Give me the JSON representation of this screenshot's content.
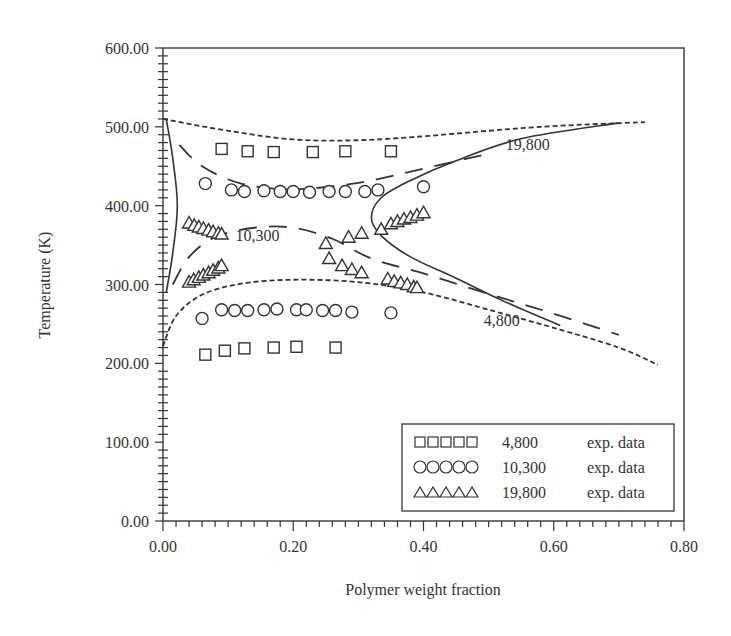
{
  "chart_data": {
    "type": "scatter",
    "title": "",
    "xlabel": "Polymer weight fraction",
    "ylabel": "Temperature (K)",
    "xlim": [
      0.0,
      0.8
    ],
    "ylim": [
      0.0,
      600.0
    ],
    "x_ticks": [
      "0.00",
      "0.20",
      "0.40",
      "0.60",
      "0.80"
    ],
    "y_ticks": [
      "0.00",
      "100.00",
      "200.00",
      "300.00",
      "400.00",
      "500.00",
      "600.00"
    ],
    "grid": false,
    "legend_position": "lower right",
    "legend": [
      {
        "marker": "square",
        "symbols": "□□□□□",
        "label": "4,800",
        "suffix": "exp. data"
      },
      {
        "marker": "circle",
        "symbols": "○○○○○",
        "label": "10,300",
        "suffix": "exp. data"
      },
      {
        "marker": "triangle",
        "symbols": "△△△△△",
        "label": "19,800",
        "suffix": "exp. data"
      }
    ],
    "curve_labels": [
      {
        "text": "19,800",
        "x": 0.56,
        "y": 470
      },
      {
        "text": "10,300",
        "x": 0.145,
        "y": 355
      },
      {
        "text": "4,800",
        "x": 0.52,
        "y": 247
      }
    ],
    "series": [
      {
        "name": "4,800 exp. data",
        "marker": "square",
        "points": [
          [
            0.09,
            472
          ],
          [
            0.13,
            469
          ],
          [
            0.17,
            468
          ],
          [
            0.23,
            468
          ],
          [
            0.28,
            469
          ],
          [
            0.35,
            469
          ],
          [
            0.065,
            211
          ],
          [
            0.095,
            216
          ],
          [
            0.125,
            219
          ],
          [
            0.17,
            220
          ],
          [
            0.205,
            221
          ],
          [
            0.265,
            220
          ]
        ]
      },
      {
        "name": "10,300 exp. data",
        "marker": "circle",
        "points": [
          [
            0.065,
            428
          ],
          [
            0.105,
            420
          ],
          [
            0.125,
            418
          ],
          [
            0.155,
            419
          ],
          [
            0.18,
            418
          ],
          [
            0.2,
            418
          ],
          [
            0.225,
            417
          ],
          [
            0.255,
            418
          ],
          [
            0.28,
            418
          ],
          [
            0.31,
            418
          ],
          [
            0.33,
            420
          ],
          [
            0.4,
            424
          ],
          [
            0.06,
            257
          ],
          [
            0.09,
            268
          ],
          [
            0.11,
            267
          ],
          [
            0.13,
            267
          ],
          [
            0.155,
            268
          ],
          [
            0.175,
            269
          ],
          [
            0.205,
            268
          ],
          [
            0.22,
            268
          ],
          [
            0.245,
            267
          ],
          [
            0.265,
            267
          ],
          [
            0.29,
            265
          ],
          [
            0.35,
            264
          ]
        ]
      },
      {
        "name": "19,800 exp. data",
        "marker": "triangle",
        "points": [
          [
            0.04,
            378
          ],
          [
            0.048,
            375
          ],
          [
            0.055,
            373
          ],
          [
            0.062,
            371
          ],
          [
            0.07,
            369
          ],
          [
            0.077,
            367
          ],
          [
            0.085,
            365
          ],
          [
            0.09,
            364
          ],
          [
            0.04,
            303
          ],
          [
            0.047,
            306
          ],
          [
            0.055,
            309
          ],
          [
            0.062,
            312
          ],
          [
            0.07,
            315
          ],
          [
            0.077,
            318
          ],
          [
            0.085,
            321
          ],
          [
            0.09,
            324
          ],
          [
            0.25,
            352
          ],
          [
            0.255,
            333
          ],
          [
            0.275,
            324
          ],
          [
            0.29,
            319
          ],
          [
            0.305,
            315
          ],
          [
            0.285,
            360
          ],
          [
            0.305,
            365
          ],
          [
            0.335,
            370
          ],
          [
            0.35,
            377
          ],
          [
            0.36,
            380
          ],
          [
            0.37,
            383
          ],
          [
            0.38,
            385
          ],
          [
            0.39,
            388
          ],
          [
            0.4,
            391
          ],
          [
            0.345,
            307
          ],
          [
            0.355,
            304
          ],
          [
            0.365,
            302
          ],
          [
            0.375,
            300
          ],
          [
            0.385,
            297
          ],
          [
            0.39,
            296
          ]
        ]
      },
      {
        "name": "4,800 model (short dash)",
        "line": "short-dash",
        "upper": [
          [
            0.0,
            510
          ],
          [
            0.1,
            495
          ],
          [
            0.2,
            484
          ],
          [
            0.3,
            483
          ],
          [
            0.4,
            488
          ],
          [
            0.5,
            495
          ],
          [
            0.6,
            501
          ],
          [
            0.74,
            506
          ]
        ],
        "lower": [
          [
            0.0,
            222
          ],
          [
            0.02,
            260
          ],
          [
            0.06,
            287
          ],
          [
            0.12,
            301
          ],
          [
            0.2,
            306
          ],
          [
            0.3,
            303
          ],
          [
            0.4,
            290
          ],
          [
            0.5,
            268
          ],
          [
            0.6,
            245
          ],
          [
            0.7,
            220
          ],
          [
            0.76,
            198
          ]
        ]
      },
      {
        "name": "10,300 model (long dash)",
        "line": "long-dash",
        "upper": [
          [
            0.025,
            477
          ],
          [
            0.06,
            450
          ],
          [
            0.12,
            428
          ],
          [
            0.2,
            421
          ],
          [
            0.3,
            429
          ],
          [
            0.4,
            447
          ],
          [
            0.5,
            466
          ]
        ],
        "lower": [
          [
            0.015,
            300
          ],
          [
            0.04,
            335
          ],
          [
            0.08,
            360
          ],
          [
            0.14,
            372
          ],
          [
            0.2,
            372
          ],
          [
            0.26,
            358
          ],
          [
            0.32,
            333
          ],
          [
            0.4,
            314
          ],
          [
            0.5,
            288
          ],
          [
            0.6,
            263
          ],
          [
            0.7,
            236
          ]
        ]
      },
      {
        "name": "19,800 model (solid)",
        "line": "solid",
        "left_branch": [
          [
            0.005,
            510
          ],
          [
            0.015,
            460
          ],
          [
            0.022,
            400
          ],
          [
            0.015,
            340
          ],
          [
            0.005,
            290
          ]
        ],
        "right_branch": [
          [
            0.7,
            505
          ],
          [
            0.55,
            485
          ],
          [
            0.45,
            457
          ],
          [
            0.38,
            432
          ],
          [
            0.335,
            410
          ],
          [
            0.32,
            385
          ],
          [
            0.335,
            362
          ],
          [
            0.38,
            335
          ],
          [
            0.45,
            308
          ],
          [
            0.52,
            280
          ],
          [
            0.61,
            248
          ]
        ]
      }
    ]
  },
  "figure": {
    "plot_area": {
      "left_px": 163,
      "right_px": 684,
      "top_px": 48,
      "bottom_px": 521
    }
  }
}
